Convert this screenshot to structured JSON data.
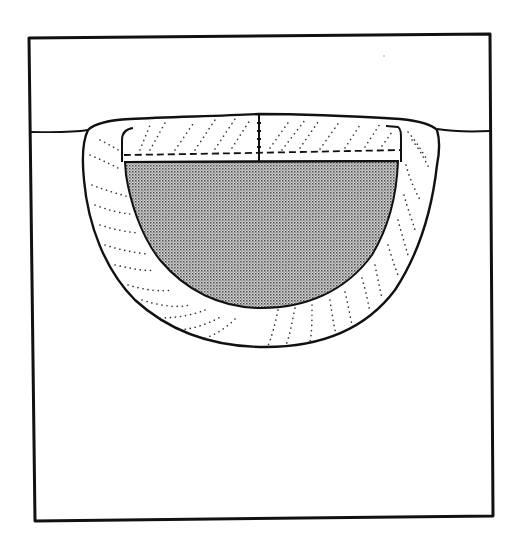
{
  "diagram": {
    "type": "cross-section",
    "subject": "weld bead cross-section",
    "labels": [],
    "regions": [
      {
        "name": "frame",
        "stroke": "#111111",
        "fill": "#ffffff"
      },
      {
        "name": "surface-line",
        "stroke": "#111111"
      },
      {
        "name": "outer-zone-dotted",
        "stroke": "#111111",
        "pattern": "dotted-diagonal"
      },
      {
        "name": "top-cap-dotted",
        "stroke": "#111111",
        "pattern": "dotted-diagonal"
      },
      {
        "name": "fusion-zone-shaded",
        "stroke": "#111111",
        "fill": "#a9a9a9",
        "pattern": "fine-dot-stipple"
      },
      {
        "name": "dashed-boundary",
        "stroke": "#111111",
        "dash": "7 4"
      },
      {
        "name": "center-line",
        "stroke": "#111111"
      }
    ],
    "colors": {
      "ink": "#111111",
      "paper": "#ffffff",
      "stipple_dot": "#4a4a4a",
      "stipple_bg": "#d6d6d6",
      "dot_line": "#333333"
    }
  }
}
